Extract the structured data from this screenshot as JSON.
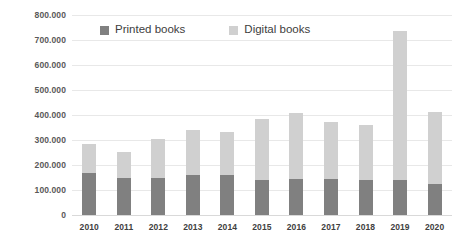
{
  "chart_data": {
    "type": "bar",
    "stacked": true,
    "title": "",
    "subtitle": "",
    "xlabel": "",
    "ylabel": "",
    "ylim": [
      0,
      800000
    ],
    "ytick_step": 100000,
    "grid": true,
    "legend_position": "top-center",
    "categories": [
      "2010",
      "2011",
      "2012",
      "2013",
      "2014",
      "2015",
      "2016",
      "2017",
      "2018",
      "2019",
      "2020"
    ],
    "ytick_labels": [
      "800.000",
      "700.000",
      "600.000",
      "500.000",
      "400.000",
      "300.000",
      "200.000",
      "100.000",
      "0"
    ],
    "ytick_values": [
      800000,
      700000,
      600000,
      500000,
      400000,
      300000,
      200000,
      100000,
      0
    ],
    "series": [
      {
        "name": "Printed books",
        "color": "#808080",
        "values": [
          168000,
          148000,
          148000,
          160000,
          160000,
          140000,
          144000,
          144000,
          140000,
          140000,
          124000
        ]
      },
      {
        "name": "Digital books",
        "color": "#d0d0d0",
        "values": [
          116000,
          104000,
          156000,
          180000,
          172000,
          244000,
          264000,
          228000,
          220000,
          596000,
          288000
        ]
      }
    ],
    "totals": [
      284000,
      252000,
      304000,
      340000,
      332000,
      384000,
      408000,
      372000,
      360000,
      736000,
      412000
    ]
  },
  "legend": {
    "items": [
      {
        "label": "Printed books",
        "color": "#808080",
        "swatch_name": "legend-swatch-printed-books"
      },
      {
        "label": "Digital books",
        "color": "#d0d0d0",
        "swatch_name": "legend-swatch-digital-books"
      }
    ]
  },
  "colors": {
    "printed_books": "#808080",
    "digital_books": "#d0d0d0",
    "gridline": "#e8e8e8",
    "background": "#ffffff",
    "axis_text": "#595959"
  }
}
